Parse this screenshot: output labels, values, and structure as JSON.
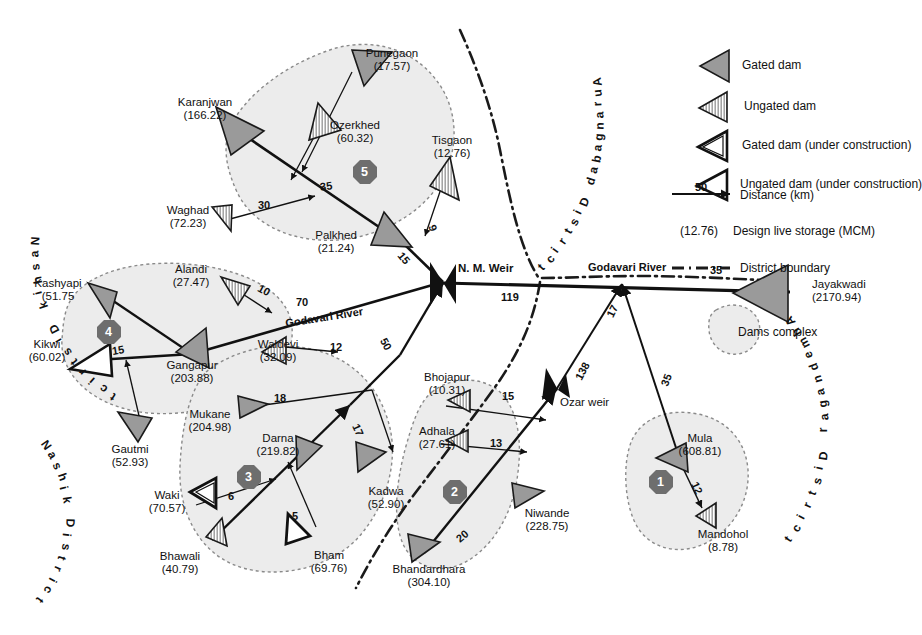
{
  "figure": {
    "districts": [
      {
        "name": "Nashik District",
        "position": "upper-left"
      },
      {
        "name": "Nashik District",
        "position": "lower-left"
      },
      {
        "name": "Aurangabad District",
        "position": "upper-right"
      },
      {
        "name": "Ahmednagar District",
        "position": "lower-right"
      }
    ],
    "rivers": [
      {
        "label": "Godavari River",
        "position": "left-segment"
      },
      {
        "label": "Godavari River",
        "position": "right-segment"
      }
    ],
    "weirs": [
      {
        "label": "N. M. Weir"
      },
      {
        "label": "Ozar weir"
      }
    ],
    "complex_badges": [
      "1",
      "2",
      "3",
      "4",
      "5"
    ]
  },
  "legend": {
    "items": [
      {
        "key": "gated-dam",
        "label": "Gated dam"
      },
      {
        "key": "ungated-dam",
        "label": "Ungated dam"
      },
      {
        "key": "gated-dam-uc",
        "label": "Gated dam (under construction)"
      },
      {
        "key": "ungated-dam-uc",
        "label": "Ungated dam (under construction)"
      },
      {
        "key": "distance",
        "label": "Distance (km)",
        "sample": "50"
      },
      {
        "key": "storage",
        "label": "Design live storage (MCM)",
        "sample": "(12.76)"
      },
      {
        "key": "district-boundary",
        "label": "District boundary"
      },
      {
        "key": "dams-complex",
        "label": "Dams complex"
      }
    ]
  },
  "dams": [
    {
      "id": "karanjwan",
      "name": "Karanjwan",
      "storage": "(166.22)",
      "type": "gated",
      "complex": "5"
    },
    {
      "id": "punegaon",
      "name": "Punegaon",
      "storage": "(17.57)",
      "type": "gated",
      "complex": "5"
    },
    {
      "id": "ozerkhed",
      "name": "Ozerkhed",
      "storage": "(60.32)",
      "type": "ungated",
      "complex": "5"
    },
    {
      "id": "tisgaon",
      "name": "Tisgaon",
      "storage": "(12.76)",
      "type": "ungated",
      "complex": "5"
    },
    {
      "id": "palkhed",
      "name": "Palkhed",
      "storage": "(21.24)",
      "type": "gated",
      "complex": "5"
    },
    {
      "id": "waghad",
      "name": "Waghad",
      "storage": "(72.23)",
      "type": "ungated",
      "complex": "5"
    },
    {
      "id": "kashyapi",
      "name": "Kashyapi",
      "storage": "(51.75",
      "type": "gated",
      "complex": "4"
    },
    {
      "id": "alandi",
      "name": "Alandi",
      "storage": "(27.47)",
      "type": "ungated",
      "complex": "4"
    },
    {
      "id": "kikwi",
      "name": "Kikwi",
      "storage": "(60.02)",
      "type": "ungated-uc",
      "complex": "4"
    },
    {
      "id": "gangapur",
      "name": "Gangapur",
      "storage": "(203.88)",
      "type": "gated",
      "complex": "4"
    },
    {
      "id": "gautmi",
      "name": "Gautmi",
      "storage": "(52.93)",
      "type": "gated",
      "complex": "4"
    },
    {
      "id": "waldevi",
      "name": "Waldevi",
      "storage": "(32.09)",
      "type": "ungated",
      "complex": "3"
    },
    {
      "id": "mukane",
      "name": "Mukane",
      "storage": "(204.98)",
      "type": "gated",
      "complex": "3"
    },
    {
      "id": "darna",
      "name": "Darna",
      "storage": "(219.82)",
      "type": "gated",
      "complex": "3"
    },
    {
      "id": "waki",
      "name": "Waki",
      "storage": "(70.57)",
      "type": "gated-uc",
      "complex": "3"
    },
    {
      "id": "bhawali",
      "name": "Bhawali",
      "storage": "(40.79)",
      "type": "ungated",
      "complex": "3"
    },
    {
      "id": "bham",
      "name": "Bham",
      "storage": "(69.76)",
      "type": "ungated-uc",
      "complex": "3"
    },
    {
      "id": "kadwa",
      "name": "Kadwa",
      "storage": "(52.90)",
      "type": "gated",
      "complex": "3"
    },
    {
      "id": "bhojapur",
      "name": "Bhojapur",
      "storage": "(10.31)",
      "type": "ungated",
      "complex": "2"
    },
    {
      "id": "adhala",
      "name": "Adhala",
      "storage": "(27.61)",
      "type": "ungated",
      "complex": "2"
    },
    {
      "id": "niwande",
      "name": "Niwande",
      "storage": "(228.75)",
      "type": "gated",
      "complex": "2"
    },
    {
      "id": "bhandardhara",
      "name": "Bhandardhara",
      "storage": "(304.10)",
      "type": "gated",
      "complex": "2"
    },
    {
      "id": "mula",
      "name": "Mula",
      "storage": "(608.81)",
      "type": "gated",
      "complex": "1"
    },
    {
      "id": "mandohol",
      "name": "Mandohol",
      "storage": "(8.78)",
      "type": "ungated",
      "complex": "1"
    },
    {
      "id": "jayakwadi",
      "name": "Jayakwadi",
      "storage": "(2170.94)",
      "type": "gated",
      "complex": ""
    }
  ],
  "distances": [
    {
      "id": "d-waghad-30",
      "value": "30"
    },
    {
      "id": "d-karanjwan-35",
      "value": "35"
    },
    {
      "id": "d-tisgaon-9",
      "value": "9"
    },
    {
      "id": "d-palkhed-15",
      "value": "15"
    },
    {
      "id": "d-alandi-10",
      "value": "10"
    },
    {
      "id": "d-godavari-70",
      "value": "70"
    },
    {
      "id": "d-kikwi-15",
      "value": "15"
    },
    {
      "id": "d-waldevi-12",
      "value": "12"
    },
    {
      "id": "d-darna-50",
      "value": "50"
    },
    {
      "id": "d-mukane-18",
      "value": "18"
    },
    {
      "id": "d-kadwa-17",
      "value": "17"
    },
    {
      "id": "d-waki-6",
      "value": "6"
    },
    {
      "id": "d-bham-5",
      "value": "5"
    },
    {
      "id": "d-nmweir-119",
      "value": "119"
    },
    {
      "id": "d-bhojapur-15",
      "value": "15"
    },
    {
      "id": "d-adhala-13",
      "value": "13"
    },
    {
      "id": "d-bhandardhara-20",
      "value": "20"
    },
    {
      "id": "d-ozarweir-138",
      "value": "138"
    },
    {
      "id": "d-confluence-17",
      "value": "17"
    },
    {
      "id": "d-mula-35",
      "value": "35"
    },
    {
      "id": "d-jayakwadi-35",
      "value": "35"
    },
    {
      "id": "d-mandohol-12",
      "value": "12"
    }
  ],
  "colors": {
    "dam_fill": "#9a9a9a",
    "dam_stroke": "#1a1a1a",
    "complex_fill": "#ececec",
    "complex_stroke": "#8a8a8a",
    "badge_fill": "#6e6e6e",
    "boundary": "#1a1a1a",
    "river": "#111111"
  }
}
